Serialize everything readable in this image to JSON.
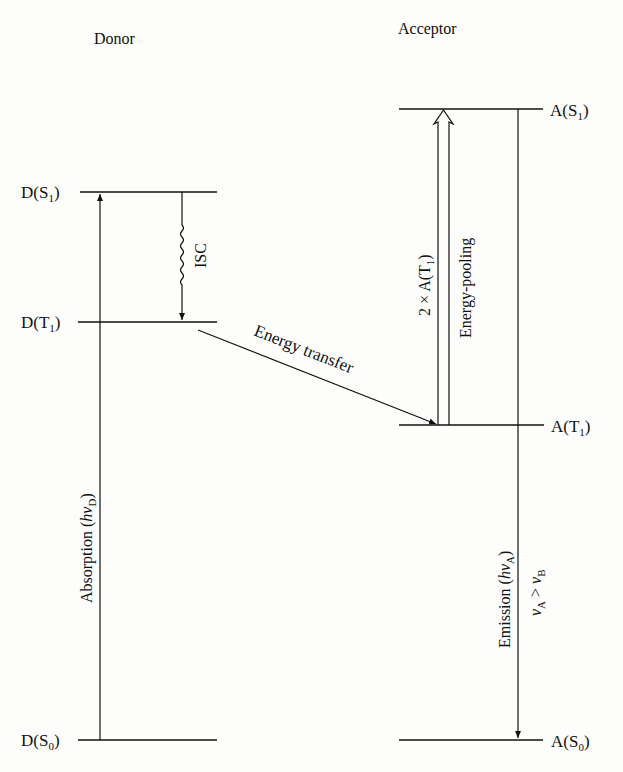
{
  "titles": {
    "donor": "Donor",
    "acceptor": "Acceptor"
  },
  "levels": {
    "d_s1": {
      "base": "D(S",
      "sub": "1",
      "close": ")"
    },
    "d_t1": {
      "base": "D(T",
      "sub": "1",
      "close": ")"
    },
    "d_s0": {
      "base": "D(S",
      "sub": "0",
      "close": ")"
    },
    "a_s1": {
      "base": "A(S",
      "sub": "1",
      "close": ")"
    },
    "a_t1": {
      "base": "A(T",
      "sub": "1",
      "close": ")"
    },
    "a_s0": {
      "base": "A(S",
      "sub": "0",
      "close": ")"
    }
  },
  "processes": {
    "isc": "ISC",
    "energy_transfer": "Energy transfer",
    "absorption": {
      "text": "Absorption (",
      "h": "h",
      "nu": "ν",
      "sub": "D",
      "close": ")"
    },
    "two_a_t1": {
      "text": "2 × A(T",
      "sub": "1",
      "close": ")"
    },
    "energy_pooling": "Energy-pooling",
    "emission": {
      "text": "Emission (",
      "h": "h",
      "nu": "ν",
      "sub": "A",
      "close": ")"
    },
    "nu_relation": {
      "nu1": "ν",
      "sub1": "A",
      "op": " > ",
      "nu2": "ν",
      "sub2": "B"
    }
  },
  "colors": {
    "ink": "#111111",
    "background": "#fdfdfb"
  }
}
